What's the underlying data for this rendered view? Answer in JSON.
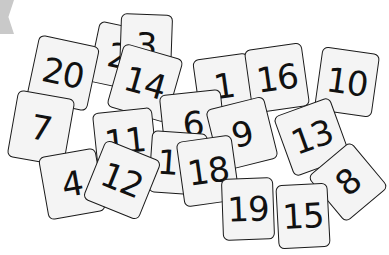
{
  "scene": {
    "description": "Scattered white numbered cards",
    "background": "#ffffff",
    "card_fill": "#f4f4f4",
    "card_border": "#1a1a1a",
    "cards": [
      {
        "label": "2",
        "x": 93,
        "y": 25,
        "w": 50,
        "h": 62,
        "rot": 12
      },
      {
        "label": "3",
        "x": 120,
        "y": 14,
        "w": 52,
        "h": 62,
        "rot": 2
      },
      {
        "label": "20",
        "x": 32,
        "y": 40,
        "w": 62,
        "h": 66,
        "rot": 12
      },
      {
        "label": "14",
        "x": 114,
        "y": 50,
        "w": 62,
        "h": 66,
        "rot": 16
      },
      {
        "label": "1",
        "x": 196,
        "y": 56,
        "w": 56,
        "h": 60,
        "rot": -8
      },
      {
        "label": "16",
        "x": 248,
        "y": 46,
        "w": 58,
        "h": 64,
        "rot": -8
      },
      {
        "label": "10",
        "x": 318,
        "y": 50,
        "w": 58,
        "h": 64,
        "rot": 8
      },
      {
        "label": "7",
        "x": 12,
        "y": 94,
        "w": 58,
        "h": 68,
        "rot": 10
      },
      {
        "label": "6",
        "x": 162,
        "y": 92,
        "w": 62,
        "h": 64,
        "rot": -6
      },
      {
        "label": "11",
        "x": 95,
        "y": 110,
        "w": 60,
        "h": 62,
        "rot": -6
      },
      {
        "label": "9",
        "x": 212,
        "y": 102,
        "w": 60,
        "h": 64,
        "rot": -14
      },
      {
        "label": "13",
        "x": 282,
        "y": 105,
        "w": 60,
        "h": 64,
        "rot": -20
      },
      {
        "label": "8",
        "x": 320,
        "y": 152,
        "w": 56,
        "h": 60,
        "rot": -40
      },
      {
        "label": "17",
        "x": 150,
        "y": 132,
        "w": 56,
        "h": 62,
        "rot": 4
      },
      {
        "label": "4",
        "x": 43,
        "y": 152,
        "w": 58,
        "h": 64,
        "rot": -10
      },
      {
        "label": "12",
        "x": 92,
        "y": 148,
        "w": 60,
        "h": 64,
        "rot": 22
      },
      {
        "label": "18",
        "x": 180,
        "y": 138,
        "w": 56,
        "h": 66,
        "rot": -8
      },
      {
        "label": "19",
        "x": 222,
        "y": 178,
        "w": 52,
        "h": 62,
        "rot": -2
      },
      {
        "label": "15",
        "x": 277,
        "y": 184,
        "w": 52,
        "h": 64,
        "rot": -3
      }
    ]
  }
}
